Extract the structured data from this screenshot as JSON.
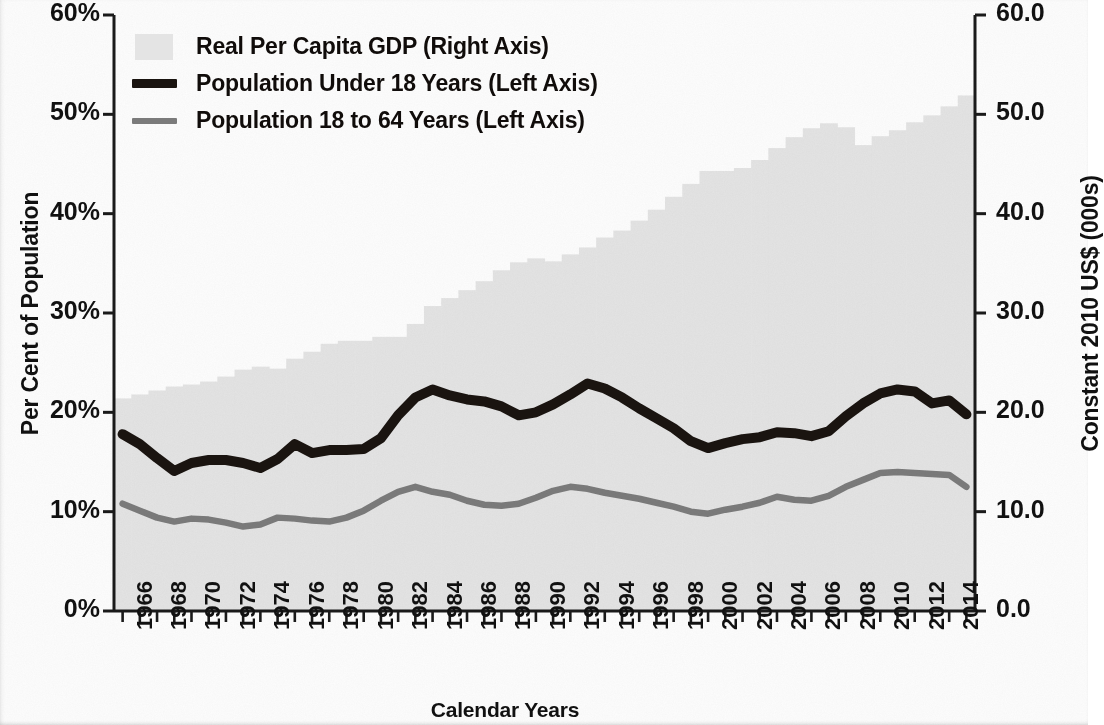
{
  "chart_data": {
    "type": "line",
    "title": "",
    "xlabel": "Calendar Years",
    "ylabel": "Per Cent of Population",
    "ylabel_right": "Constant 2010 US$ (000s)",
    "grid": false,
    "legend_position": "top-left",
    "ylim": [
      0,
      60
    ],
    "ylim_right": [
      0.0,
      60.0
    ],
    "yticks": [
      "0%",
      "10%",
      "20%",
      "30%",
      "40%",
      "50%",
      "60%"
    ],
    "yticks_right": [
      "0.0",
      "10.0",
      "20.0",
      "30.0",
      "40.0",
      "50.0",
      "60.0"
    ],
    "xlim": [
      1966,
      2015
    ],
    "xticks": [
      "1966",
      "1968",
      "1970",
      "1972",
      "1974",
      "1976",
      "1978",
      "1980",
      "1982",
      "1984",
      "1986",
      "1988",
      "1990",
      "1992",
      "1994",
      "1996",
      "1998",
      "2000",
      "2002",
      "2004",
      "2006",
      "2008",
      "2010",
      "2012",
      "2014"
    ],
    "x": [
      1966,
      1967,
      1968,
      1969,
      1970,
      1971,
      1972,
      1973,
      1974,
      1975,
      1976,
      1977,
      1978,
      1979,
      1980,
      1981,
      1982,
      1983,
      1984,
      1985,
      1986,
      1987,
      1988,
      1989,
      1990,
      1991,
      1992,
      1993,
      1994,
      1995,
      1996,
      1997,
      1998,
      1999,
      2000,
      2001,
      2002,
      2003,
      2004,
      2005,
      2006,
      2007,
      2008,
      2009,
      2010,
      2011,
      2012,
      2013,
      2014,
      2015
    ],
    "series": [
      {
        "name": "Real Per Capita GDP (Right Axis)",
        "axis": "right",
        "type": "area",
        "color": "#e4e4e4",
        "values": [
          21.4,
          21.8,
          22.2,
          22.6,
          22.8,
          23.1,
          23.6,
          24.3,
          24.6,
          24.4,
          25.4,
          26.1,
          26.9,
          27.2,
          27.2,
          27.6,
          27.6,
          28.9,
          30.7,
          31.5,
          32.3,
          33.2,
          34.3,
          35.1,
          35.5,
          35.2,
          35.9,
          36.6,
          37.6,
          38.3,
          39.3,
          40.4,
          41.7,
          43.0,
          44.3,
          44.3,
          44.6,
          45.4,
          46.6,
          47.7,
          48.6,
          49.1,
          48.7,
          46.9,
          47.8,
          48.4,
          49.2,
          49.9,
          50.8,
          51.9
        ]
      },
      {
        "name": "Population Under 18 Years (Left Axis)",
        "axis": "left",
        "type": "line",
        "color": "#1a1410",
        "values": [
          17.8,
          16.8,
          15.4,
          14.1,
          14.9,
          15.2,
          15.2,
          14.9,
          14.4,
          15.3,
          16.8,
          15.9,
          16.2,
          16.2,
          16.3,
          17.4,
          19.7,
          21.5,
          22.3,
          21.7,
          21.3,
          21.1,
          20.6,
          19.7,
          20.0,
          20.8,
          21.8,
          22.9,
          22.4,
          21.5,
          20.4,
          19.4,
          18.4,
          17.1,
          16.4,
          16.9,
          17.3,
          17.5,
          18.0,
          17.9,
          17.6,
          18.1,
          19.6,
          20.9,
          21.9,
          22.3,
          22.1,
          20.9,
          21.2,
          19.8
        ]
      },
      {
        "name": "Population 18 to 64 Years (Left Axis)",
        "axis": "left",
        "type": "line",
        "color": "#7b7b7b",
        "values": [
          10.8,
          10.1,
          9.4,
          9.0,
          9.3,
          9.2,
          8.9,
          8.5,
          8.7,
          9.4,
          9.3,
          9.1,
          9.0,
          9.4,
          10.1,
          11.1,
          12.0,
          12.5,
          12.0,
          11.7,
          11.1,
          10.7,
          10.6,
          10.8,
          11.4,
          12.1,
          12.5,
          12.3,
          11.9,
          11.6,
          11.3,
          10.9,
          10.5,
          10.0,
          9.8,
          10.2,
          10.5,
          10.9,
          11.5,
          11.2,
          11.1,
          11.6,
          12.5,
          13.2,
          13.9,
          14.0,
          13.9,
          13.8,
          13.7,
          12.5
        ]
      }
    ]
  },
  "legend": {
    "items": [
      {
        "label": "Real Per Capita GDP (Right Axis)",
        "marker": "area-swatch"
      },
      {
        "label": "Population Under 18 Years (Left Axis)",
        "marker": "thick-black-line"
      },
      {
        "label": "Population 18 to 64 Years (Left Axis)",
        "marker": "gray-line"
      }
    ]
  },
  "axes": {
    "left_title": "Per Cent of Population",
    "right_title": "Constant 2010 US$ (000s)",
    "bottom_title": "Calendar Years"
  },
  "colors": {
    "area_fill": "#e4e4e4",
    "under18_line": "#1a1410",
    "age18to64_line": "#7b7b7b",
    "axis": "#1a1a1a",
    "text": "#111111",
    "background": "#ffffff"
  }
}
